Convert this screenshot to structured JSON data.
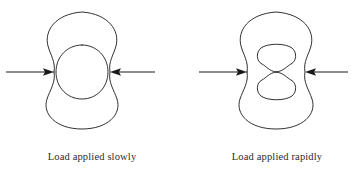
{
  "figure": {
    "background_color": "#ffffff",
    "stroke_color": "#1a1a1a",
    "text_color": "#2b2b2b",
    "panels": [
      {
        "id": "slowly",
        "caption": "Load applied slowly",
        "caption_x": 92,
        "caption_y": 160,
        "outer_shape": "peanut",
        "inner_shape": "circle",
        "arrow_direction_left": "right",
        "arrow_direction_right": "left",
        "waist_y": 72,
        "left_pinch_x": 54,
        "right_pinch_x": 110,
        "left_arrow_start_x": 6,
        "right_arrow_end_x": 155
      },
      {
        "id": "rapidly",
        "caption": "Load applied rapidly",
        "caption_x": 277,
        "caption_y": 160,
        "outer_shape": "peanut",
        "inner_shape": "peanut",
        "arrow_direction_left": "right",
        "arrow_direction_right": "left",
        "waist_y": 72,
        "left_pinch_x": 247,
        "right_pinch_x": 305,
        "left_arrow_start_x": 199,
        "right_arrow_end_x": 348
      }
    ],
    "legend": {
      "arrow_icon_name": "load-arrow-icon",
      "arrow_label": "applied load"
    }
  }
}
